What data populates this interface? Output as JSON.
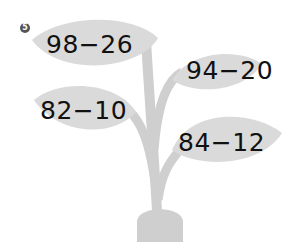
{
  "problem": {
    "number": "5",
    "expressions": [
      {
        "text": "98−26",
        "position": "top-left"
      },
      {
        "text": "94−20",
        "position": "top-right"
      },
      {
        "text": "82−10",
        "position": "middle-left"
      },
      {
        "text": "84−12",
        "position": "bottom-right"
      }
    ]
  },
  "colors": {
    "leaf": "#d9d9d9",
    "stem": "#cfcfcf",
    "pot": "#cfcfcf",
    "text": "#111111"
  }
}
